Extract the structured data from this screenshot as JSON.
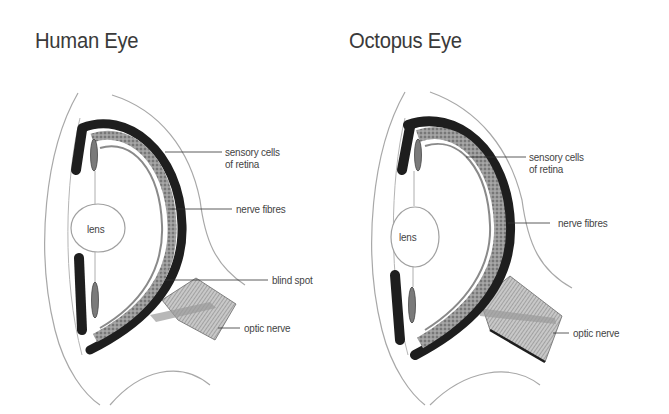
{
  "diagrams": [
    {
      "title": "Human Eye",
      "labels": {
        "lens": "lens",
        "sensory_cells": "sensory cells",
        "sensory_cells_line2": "of retina",
        "nerve_fibres": "nerve fibres",
        "blind_spot": "blind spot",
        "optic_nerve": "optic nerve"
      }
    },
    {
      "title": "Octopus Eye",
      "labels": {
        "lens": "lens",
        "sensory_cells": "sensory cells",
        "sensory_cells_line2": "of retina",
        "nerve_fibres": "nerve fibres",
        "optic_nerve": "optic nerve"
      }
    }
  ],
  "colors": {
    "retina_dark": "#1e1e1e",
    "retina_gray": "#8a8a8a",
    "outline": "#a0a0a0",
    "nerve": "#b5b5b5"
  }
}
